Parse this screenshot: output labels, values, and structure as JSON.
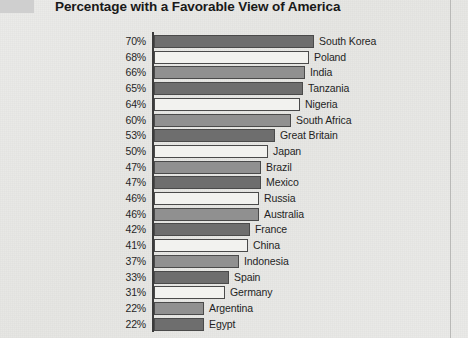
{
  "chart_data": {
    "type": "bar",
    "orientation": "horizontal",
    "title": "Percentage with a Favorable View of America",
    "xlabel": "",
    "ylabel": "",
    "xlim": [
      0,
      74
    ],
    "grid": false,
    "legend": null,
    "value_suffix": "%",
    "categories": [
      "South Korea",
      "Poland",
      "India",
      "Tanzania",
      "Nigeria",
      "South Africa",
      "Great Britain",
      "Japan",
      "Brazil",
      "Mexico",
      "Russia",
      "Australia",
      "France",
      "China",
      "Indonesia",
      "Spain",
      "Germany",
      "Argentina",
      "Egypt"
    ],
    "values": [
      70,
      68,
      66,
      65,
      64,
      60,
      53,
      50,
      47,
      47,
      46,
      46,
      42,
      41,
      37,
      33,
      31,
      22,
      22
    ],
    "value_labels": [
      "70%",
      "68%",
      "66%",
      "65%",
      "64%",
      "60%",
      "53%",
      "50%",
      "47%",
      "47%",
      "46%",
      "46%",
      "42%",
      "41%",
      "37%",
      "33%",
      "31%",
      "22%",
      "22%"
    ],
    "bar_shades": [
      "dark",
      "light",
      "mid",
      "dark",
      "light",
      "mid",
      "dark",
      "light",
      "mid",
      "dark",
      "light",
      "mid",
      "dark",
      "light",
      "mid",
      "dark",
      "light",
      "mid",
      "dark"
    ],
    "colors": {
      "bar_dark": "#6e6e6e",
      "bar_mid": "#909090",
      "bar_light": "#f2f2ef",
      "bar_outline": "#4a4a4a",
      "axis": "#3b3b3b",
      "background": "#e8e8e6",
      "text": "#1f1f1f",
      "title": "#191919"
    }
  },
  "page": {
    "corner_mark": "",
    "right_rule": ""
  }
}
